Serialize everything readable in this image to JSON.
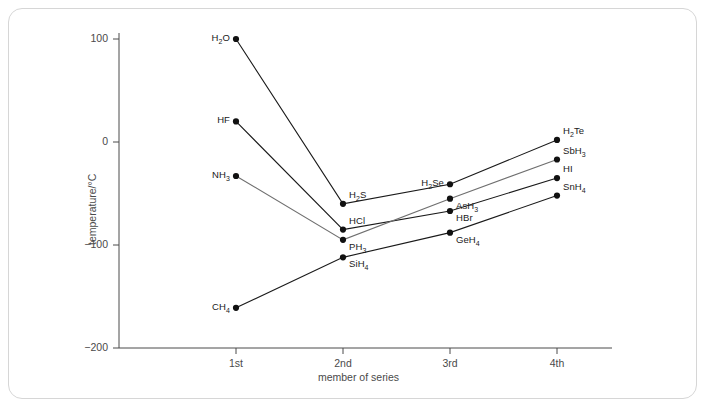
{
  "chart_data": {
    "type": "line",
    "title": "",
    "xlabel": "member of series",
    "ylabel": "temperature/°C",
    "x": [
      "1st",
      "2nd",
      "3rd",
      "4th"
    ],
    "xtick_labels": [
      "1st",
      "2nd",
      "3rd",
      "4th"
    ],
    "ytick_labels": [
      "100",
      "0",
      "−100",
      "−200"
    ],
    "ytick_values": [
      100,
      0,
      -100,
      -200
    ],
    "ylim": [
      -200,
      130
    ],
    "grid": false,
    "legend": "none (points labelled inline)",
    "series": [
      {
        "name": "Group 16 hydrides",
        "color": "#1a1a1a",
        "points": [
          {
            "x": "1st",
            "y": 100,
            "label": "H₂O",
            "label_side": "left"
          },
          {
            "x": "2nd",
            "y": -60,
            "label": "H₂S",
            "label_side": "right"
          },
          {
            "x": "3rd",
            "y": -41,
            "label": "H₂Se",
            "label_side": "left"
          },
          {
            "x": "4th",
            "y": 2,
            "label": "H₂Te",
            "label_side": "right"
          }
        ]
      },
      {
        "name": "Group 17 hydrides",
        "color": "#1a1a1a",
        "points": [
          {
            "x": "1st",
            "y": 20,
            "label": "HF",
            "label_side": "left"
          },
          {
            "x": "2nd",
            "y": -85,
            "label": "HCl",
            "label_side": "right"
          },
          {
            "x": "3rd",
            "y": -67,
            "label": "HBr",
            "label_side": "right"
          },
          {
            "x": "4th",
            "y": -35,
            "label": "HI",
            "label_side": "right"
          }
        ]
      },
      {
        "name": "Group 15 hydrides",
        "color": "#6f6f6f",
        "points": [
          {
            "x": "1st",
            "y": -33,
            "label": "NH₃",
            "label_side": "left"
          },
          {
            "x": "2nd",
            "y": -95,
            "label": "PH₃",
            "label_side": "right"
          },
          {
            "x": "3rd",
            "y": -55,
            "label": "AsH₃",
            "label_side": "right"
          },
          {
            "x": "4th",
            "y": -17,
            "label": "SbH₃",
            "label_side": "right"
          }
        ]
      },
      {
        "name": "Group 14 hydrides",
        "color": "#1a1a1a",
        "points": [
          {
            "x": "1st",
            "y": -161,
            "label": "CH₄",
            "label_side": "left"
          },
          {
            "x": "2nd",
            "y": -112,
            "label": "SiH₄",
            "label_side": "right"
          },
          {
            "x": "3rd",
            "y": -88,
            "label": "GeH₄",
            "label_side": "right"
          },
          {
            "x": "4th",
            "y": -52,
            "label": "SnH₄",
            "label_side": "right"
          }
        ]
      }
    ]
  }
}
